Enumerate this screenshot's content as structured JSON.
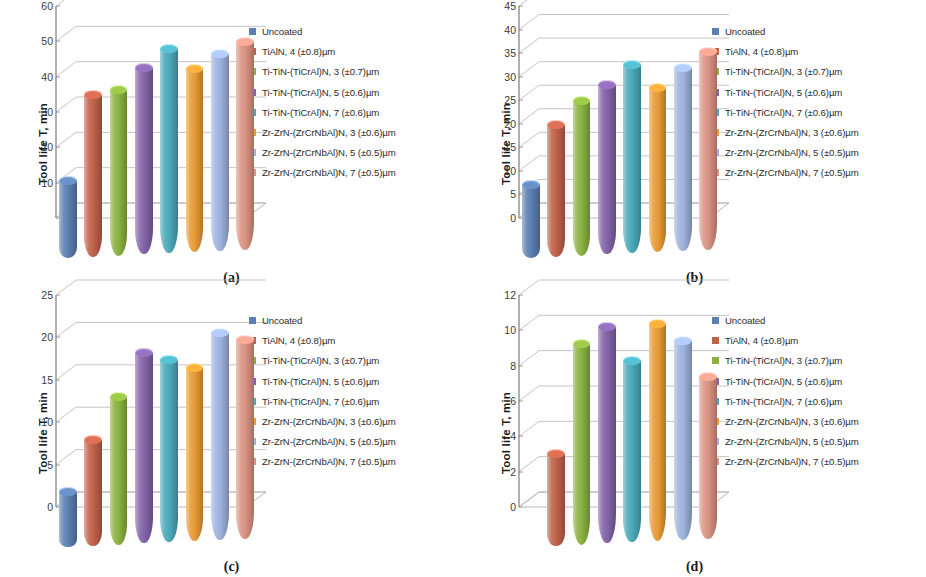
{
  "figure": {
    "axis_label": "Tool life T, min",
    "series": [
      {
        "label": "Uncoated",
        "color": "#5b7fb0"
      },
      {
        "label": "TiAlN, 4 (±0.8)µm",
        "color": "#c0614a"
      },
      {
        "label": "Ti-TiN-(TiCrAl)N, 3 (±0.7)µm",
        "color": "#8ab13f"
      },
      {
        "label": "Ti-TiN-(TiCrAl)N, 5 (±0.6)µm",
        "color": "#8363a8"
      },
      {
        "label": "Ti-TiN-(TiCrAl)N, 7 (±0.6)µm",
        "color": "#4aa8b8"
      },
      {
        "label": "Zr-ZrN-(ZrCrNbAl)N, 3 (±0.6)µm",
        "color": "#e89a35"
      },
      {
        "label": "Zr-ZrN-(ZrCrNbAl)N, 5 (±0.5)µm",
        "color": "#9db2dc"
      },
      {
        "label": "Zr-ZrN-(ZrCrNbAl)N, 7 (±0.5)µm",
        "color": "#d99383"
      }
    ]
  },
  "chart_data": [
    {
      "type": "bar",
      "panel": "(a)",
      "title": "",
      "xlabel": "",
      "ylabel": "Tool life T, min",
      "ylim": [
        0,
        60
      ],
      "yticks": [
        0,
        10,
        20,
        30,
        40,
        50,
        60
      ],
      "ytick_labels": [
        "",
        "10",
        "20",
        "30",
        "40",
        "50",
        "60"
      ],
      "grid": true,
      "legend_position": "right",
      "categories": [
        "Uncoated",
        "TiAlN, 4 (±0.8)µm",
        "Ti-TiN-(TiCrAl)N, 3 (±0.7)µm",
        "Ti-TiN-(TiCrAl)N, 5 (±0.6)µm",
        "Ti-TiN-(TiCrAl)N, 7 (±0.6)µm",
        "Zr-ZrN-(ZrCrNbAl)N, 3 (±0.6)µm",
        "Zr-ZrN-(ZrCrNbAl)N, 5 (±0.5)µm",
        "Zr-ZrN-(ZrCrNbAl)N, 7 (±0.5)µm"
      ],
      "values": [
        22,
        46,
        47,
        53,
        58,
        52,
        56,
        59
      ]
    },
    {
      "type": "bar",
      "panel": "(b)",
      "title": "",
      "xlabel": "",
      "ylabel": "Tool life T, min",
      "ylim": [
        0,
        45
      ],
      "yticks": [
        0,
        5,
        10,
        15,
        20,
        25,
        30,
        35,
        40,
        45
      ],
      "ytick_labels": [
        "0",
        "5",
        "10",
        "15",
        "20",
        "25",
        "30",
        "35",
        "40",
        "45"
      ],
      "grid": true,
      "legend_position": "right",
      "categories": [
        "Uncoated",
        "TiAlN, 4 (±0.8)µm",
        "Ti-TiN-(TiCrAl)N, 3 (±0.7)µm",
        "Ti-TiN-(TiCrAl)N, 5 (±0.6)µm",
        "Ti-TiN-(TiCrAl)N, 7 (±0.6)µm",
        "Zr-ZrN-(ZrCrNbAl)N, 3 (±0.6)µm",
        "Zr-ZrN-(ZrCrNbAl)N, 5 (±0.5)µm",
        "Zr-ZrN-(ZrCrNbAl)N, 7 (±0.5)µm"
      ],
      "values": [
        15.5,
        28,
        33,
        36,
        40,
        35,
        39,
        42
      ]
    },
    {
      "type": "bar",
      "panel": "(c)",
      "title": "",
      "xlabel": "",
      "ylabel": "Tool life T, min",
      "ylim": [
        0,
        25
      ],
      "yticks": [
        0,
        5,
        10,
        15,
        20,
        25
      ],
      "ytick_labels": [
        "0",
        "5",
        "10",
        "15",
        "20",
        "25"
      ],
      "grid": true,
      "legend_position": "right",
      "categories": [
        "Uncoated",
        "TiAlN, 4 (±0.8)µm",
        "Ti-TiN-(TiCrAl)N, 3 (±0.7)µm",
        "Ti-TiN-(TiCrAl)N, 5 (±0.6)µm",
        "Ti-TiN-(TiCrAl)N, 7 (±0.6)µm",
        "Zr-ZrN-(ZrCrNbAl)N, 3 (±0.6)µm",
        "Zr-ZrN-(ZrCrNbAl)N, 5 (±0.5)µm",
        "Zr-ZrN-(ZrCrNbAl)N, 7 (±0.5)µm"
      ],
      "values": [
        6.5,
        12.5,
        17.5,
        22.5,
        21.5,
        20.5,
        24.5,
        23.5
      ]
    },
    {
      "type": "bar",
      "panel": "(d)",
      "title": "",
      "xlabel": "",
      "ylabel": "Tool life T, min",
      "ylim": [
        0,
        12
      ],
      "yticks": [
        0,
        2,
        4,
        6,
        8,
        10,
        12
      ],
      "ytick_labels": [
        "0",
        "2",
        "4",
        "6",
        "8",
        "10",
        "12"
      ],
      "grid": true,
      "legend_position": "right",
      "categories": [
        "Uncoated",
        "TiAlN, 4 (±0.8)µm",
        "Ti-TiN-(TiCrAl)N, 3 (±0.7)µm",
        "Ti-TiN-(TiCrAl)N, 5 (±0.6)µm",
        "Ti-TiN-(TiCrAl)N, 7 (±0.6)µm",
        "Zr-ZrN-(ZrCrNbAl)N, 3 (±0.6)µm",
        "Zr-ZrN-(ZrCrNbAl)N, 5 (±0.5)µm",
        "Zr-ZrN-(ZrCrNbAl)N, 7 (±0.5)µm"
      ],
      "values": [
        0,
        5.2,
        11.4,
        12.3,
        10.3,
        12.3,
        11.3,
        9.2
      ]
    }
  ]
}
